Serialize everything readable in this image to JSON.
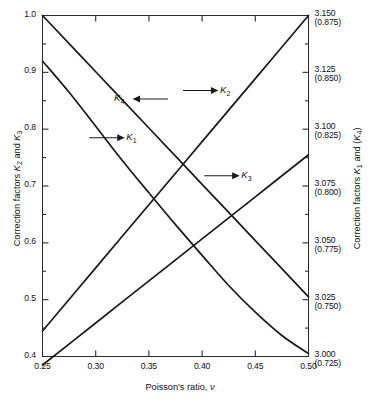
{
  "chart_data": {
    "type": "line",
    "title": "",
    "xlabel": "Poisson's ratio, ν",
    "ylabel": "Correction factors K2 and K3",
    "ylabel_right": "Correction factors K1 and (K4)",
    "xlim": [
      0.25,
      0.5
    ],
    "ylim": [
      0.4,
      1.0
    ],
    "ylim_right": [
      3.0,
      3.15
    ],
    "ylim_right_secondary": [
      0.725,
      0.875
    ],
    "grid": false,
    "legend": "inline-annotations",
    "x_ticks": [
      "0.25",
      "0.30",
      "0.35",
      "0.40",
      "0.45",
      "0.50"
    ],
    "x_tick_values": [
      0.25,
      0.3,
      0.35,
      0.4,
      0.45,
      0.5
    ],
    "x_minor_step": 0.025,
    "y_left_ticks": [
      "0.4",
      "0.5",
      "0.6",
      "0.7",
      "0.8",
      "0.9",
      "1.0"
    ],
    "y_left_tick_values": [
      0.4,
      0.5,
      0.6,
      0.7,
      0.8,
      0.9,
      1.0
    ],
    "y_left_minor_step": 0.05,
    "y_right_ticks": [
      {
        "main": "3.150",
        "paren": "(0.875)",
        "value": 1.0
      },
      {
        "main": "3.125",
        "paren": "(0.850)",
        "value": 0.9
      },
      {
        "main": "3.100",
        "paren": "(0.825)",
        "value": 0.8
      },
      {
        "main": "3.075",
        "paren": "(0.800)",
        "value": 0.7
      },
      {
        "main": "3.050",
        "paren": "(0.775)",
        "value": 0.6
      },
      {
        "main": "3.025",
        "paren": "(0.750)",
        "value": 0.5
      },
      {
        "main": "3.000",
        "paren": "(0.725)",
        "value": 0.4
      }
    ],
    "series": [
      {
        "name": "K1",
        "label": "K",
        "sub": "1",
        "axis": "right",
        "shape": "decreasing-convex",
        "x": [
          0.25,
          0.275,
          0.3,
          0.325,
          0.35,
          0.375,
          0.4,
          0.425,
          0.45,
          0.475,
          0.5
        ],
        "y_plot": [
          0.92,
          0.865,
          0.805,
          0.745,
          0.688,
          0.632,
          0.578,
          0.525,
          0.478,
          0.437,
          0.405
        ],
        "annotation": {
          "text": "K1",
          "x": 0.31,
          "y": 0.785,
          "arrow": "right"
        }
      },
      {
        "name": "K2",
        "label": "K",
        "sub": "2",
        "axis": "left",
        "shape": "increasing-linear",
        "x": [
          0.25,
          0.3,
          0.35,
          0.4,
          0.45,
          0.5
        ],
        "y_plot": [
          0.445,
          0.556,
          0.667,
          0.778,
          0.889,
          1.0
        ],
        "annotation": {
          "text": "K2",
          "x": 0.398,
          "y": 0.868,
          "arrow": "right"
        }
      },
      {
        "name": "K3",
        "label": "K",
        "sub": "3",
        "axis": "left",
        "shape": "increasing-linear",
        "x": [
          0.25,
          0.3,
          0.35,
          0.4,
          0.45,
          0.5
        ],
        "y_plot": [
          0.385,
          0.459,
          0.533,
          0.607,
          0.681,
          0.755
        ],
        "annotation": {
          "text": "K3",
          "x": 0.418,
          "y": 0.718,
          "arrow": "right"
        }
      },
      {
        "name": "K4",
        "label": "K",
        "sub": "4",
        "axis": "right",
        "shape": "decreasing-linear",
        "x": [
          0.25,
          0.3,
          0.35,
          0.4,
          0.45,
          0.5
        ],
        "y_plot": [
          1.0,
          0.901,
          0.802,
          0.703,
          0.604,
          0.505
        ],
        "annotation": {
          "text": "K4",
          "x": 0.352,
          "y": 0.853,
          "arrow": "left"
        }
      }
    ]
  },
  "axes": {
    "x_title_prefix": "Poisson's ratio, ",
    "x_title_symbol": "ν",
    "y_left_title_prefix": "Correction factors ",
    "y_left_title_k2": "K",
    "y_left_title_k2_sub": "2",
    "y_left_title_mid": " and ",
    "y_left_title_k3": "K",
    "y_left_title_k3_sub": "3",
    "y_right_title_prefix": "Correction factors ",
    "y_right_title_k1": "K",
    "y_right_title_k1_sub": "1",
    "y_right_title_mid": " and (",
    "y_right_title_k4": "K",
    "y_right_title_k4_sub": "4",
    "y_right_title_suffix": ")"
  }
}
